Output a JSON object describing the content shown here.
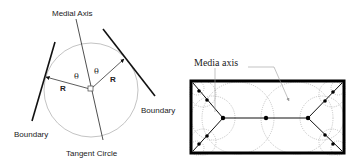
{
  "left_diagram": {
    "labels": {
      "medial_axis": "Medial Axis",
      "boundary_left": "Boundary",
      "boundary_right": "Boundary",
      "tangent_circle": "Tangent Circle",
      "radius_left": "R",
      "radius_right": "R",
      "theta_left": "θ",
      "theta_right": "θ"
    },
    "colors": {
      "circle": "#bbbbbb",
      "lines": "#111111"
    }
  },
  "right_diagram": {
    "labels": {
      "media_axis": "Media axis"
    },
    "colors": {
      "border": "#000000",
      "dotted_circles": "#999999",
      "axis": "#111111"
    }
  }
}
